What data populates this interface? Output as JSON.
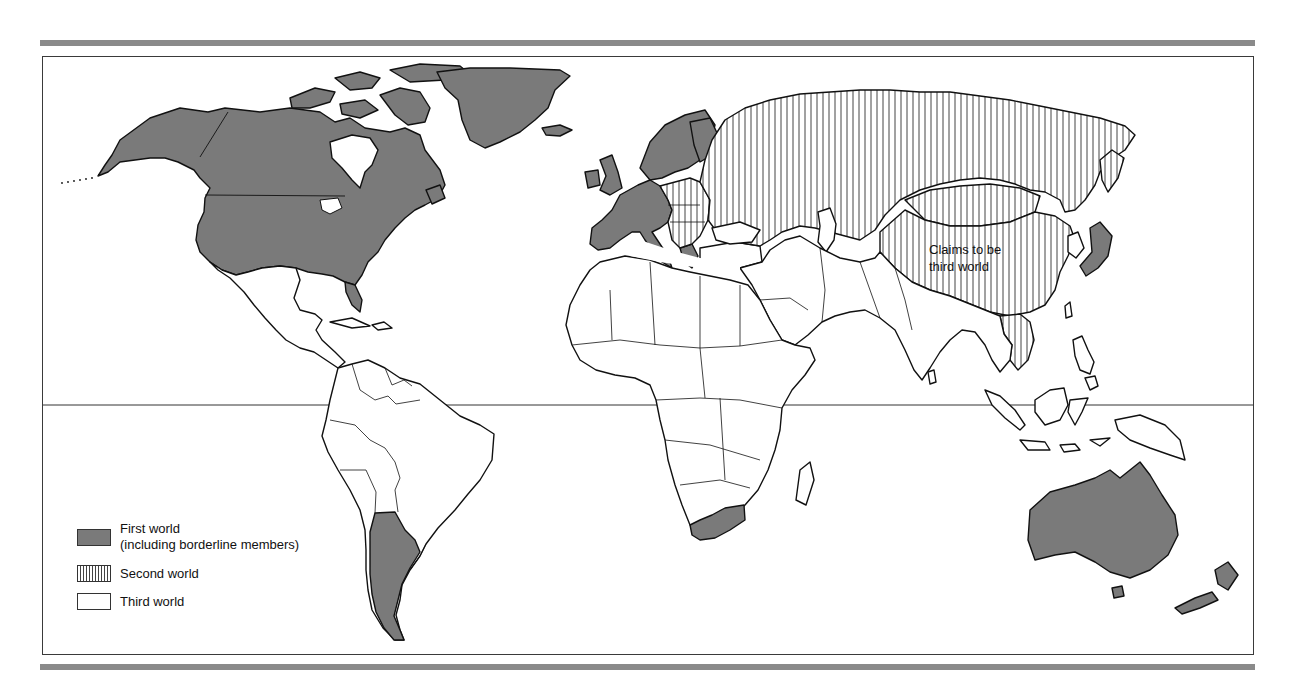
{
  "map": {
    "type": "world political classification map",
    "colors": {
      "first_world_fill": "#7a7a7a",
      "second_world_hatch": "#444444",
      "third_world_fill": "#ffffff",
      "outline": "#111111",
      "rule_bar": "#8a8a8a"
    },
    "annotation": {
      "line1": "Claims to be",
      "line2": "third world",
      "refers_to": "China"
    },
    "equator_line": true
  },
  "legend": {
    "items": [
      {
        "key": "first",
        "label_line1": "First world",
        "label_line2": "(including borderline members)",
        "pattern": "solid-gray"
      },
      {
        "key": "second",
        "label": "Second world",
        "pattern": "vertical-hatch"
      },
      {
        "key": "third",
        "label": "Third world",
        "pattern": "white"
      }
    ]
  },
  "regions": {
    "first_world": [
      "North America",
      "Greenland",
      "Western Europe",
      "Scandinavia",
      "Japan",
      "Australia",
      "New Zealand",
      "South Africa",
      "Argentina"
    ],
    "second_world": [
      "USSR",
      "Eastern Europe",
      "Mongolia",
      "China",
      "Indochina"
    ],
    "third_world": [
      "Latin America",
      "Africa",
      "Middle East",
      "South Asia",
      "Southeast Asia"
    ]
  }
}
